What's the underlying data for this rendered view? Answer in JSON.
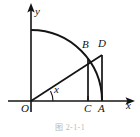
{
  "figure": {
    "caption": "图 2-1-1",
    "axes": {
      "x_axis_label": "x",
      "y_axis_label": "y",
      "origin_label": "O"
    },
    "angle": {
      "label": "x",
      "vertex": "O",
      "description": "angle between positive x-axis and ray OD"
    },
    "points": [
      {
        "name": "O",
        "label": "O",
        "x": 31,
        "y": 101,
        "on": "origin"
      },
      {
        "name": "C",
        "label": "C",
        "x": 88,
        "y": 101,
        "on": "x-axis"
      },
      {
        "name": "A",
        "label": "A",
        "x": 102,
        "y": 101,
        "on": "x-axis"
      },
      {
        "name": "B",
        "label": "B",
        "x": 88,
        "y": 58,
        "on": "arc"
      },
      {
        "name": "D",
        "label": "D",
        "x": 102,
        "y": 55,
        "on": "tangent-line"
      }
    ],
    "segments": [
      {
        "name": "OD",
        "from": "O",
        "to": "D"
      },
      {
        "name": "BC",
        "from": "B",
        "to": "C"
      },
      {
        "name": "DA",
        "from": "D",
        "to": "A"
      }
    ],
    "arc": {
      "name": "arc-BA",
      "center": "O",
      "start": {
        "x": 31,
        "y": 30
      },
      "end": {
        "x": 102,
        "y": 101
      },
      "radius": 71,
      "description": "quarter circle from y-axis through B to A"
    },
    "colors": {
      "stroke": "#141414",
      "background": "#ffffff",
      "caption": "#b9b9b9"
    }
  }
}
